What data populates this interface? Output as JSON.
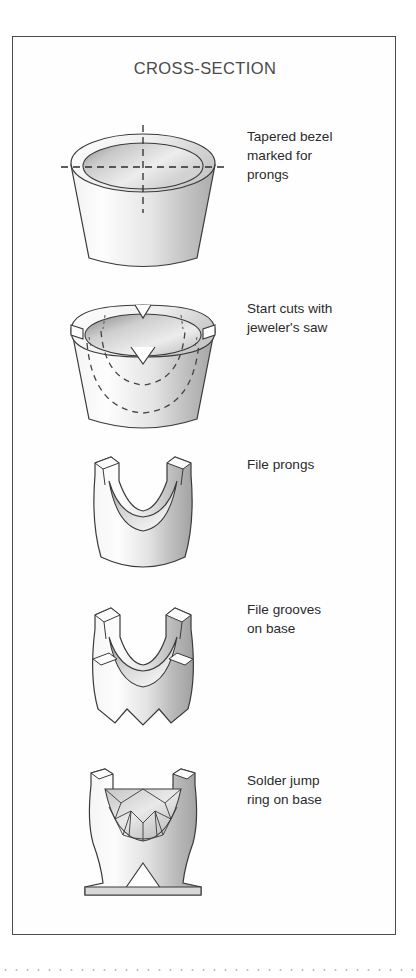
{
  "figure": {
    "title": "CROSS-SECTION",
    "frame_color": "#4b4b4b",
    "background_color": "#ffffff",
    "metal_light": "#fdfdfd",
    "metal_mid": "#dcdcdc",
    "metal_dark": "#9a9a9a",
    "outline_color": "#3a3a3a",
    "dash_color": "#2b2b2b"
  },
  "steps": [
    {
      "index": 1,
      "caption": "Tapered bezel\nmarked for\nprongs",
      "art_name": "tapered-bezel-marked-illustration",
      "caption_top": 90,
      "art_top": 78
    },
    {
      "index": 2,
      "caption": "Start cuts with\njeweler's saw",
      "art_name": "bezel-start-cuts-illustration",
      "caption_top": 262,
      "art_top": 248
    },
    {
      "index": 3,
      "caption": "File prongs",
      "art_name": "filed-prongs-illustration",
      "caption_top": 418,
      "art_top": 408
    },
    {
      "index": 4,
      "caption": "File grooves\non base",
      "art_name": "filed-grooves-base-illustration",
      "caption_top": 563,
      "art_top": 560
    },
    {
      "index": 5,
      "caption": "Solder jump\nring on base",
      "art_name": "solder-jump-ring-illustration",
      "caption_top": 732,
      "art_top": 722
    }
  ],
  "footer": {
    "dotted_rule": "dotted-separator"
  }
}
